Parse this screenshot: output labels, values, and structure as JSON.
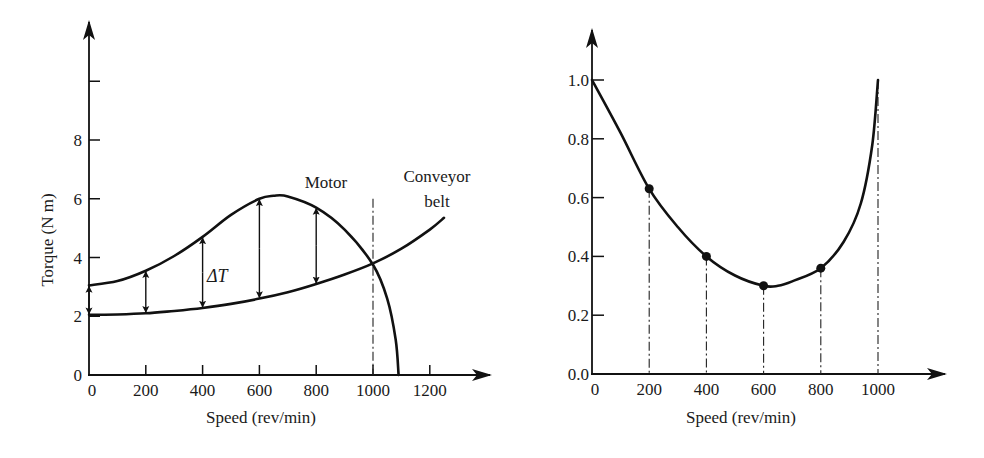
{
  "chart_data": [
    {
      "id": "torque-speed",
      "type": "line",
      "title": "",
      "xlabel": "Speed (rev/min)",
      "ylabel": "Torque (N m)",
      "xlim": [
        0,
        1350
      ],
      "ylim": [
        0,
        10
      ],
      "xticks": [
        0,
        200,
        400,
        600,
        800,
        1000,
        1200
      ],
      "xtick_labels": [
        "0",
        "200",
        "400",
        "600",
        "800",
        "1000",
        "1200"
      ],
      "yticks": [
        0,
        2,
        4,
        6,
        8,
        10
      ],
      "ytick_labels": [
        "0",
        "2",
        "4",
        "6",
        "8",
        ""
      ],
      "grid": false,
      "series": [
        {
          "name": "Motor",
          "x": [
            0,
            100,
            200,
            300,
            400,
            500,
            600,
            650,
            700,
            800,
            900,
            1000,
            1050,
            1080,
            1090
          ],
          "y": [
            3.05,
            3.2,
            3.55,
            4.05,
            4.7,
            5.45,
            6.0,
            6.1,
            6.08,
            5.7,
            4.95,
            3.75,
            2.6,
            1.2,
            0
          ]
        },
        {
          "name": "Conveyor belt",
          "x": [
            0,
            100,
            200,
            300,
            400,
            500,
            600,
            700,
            800,
            900,
            1000,
            1100,
            1200,
            1250
          ],
          "y": [
            2.05,
            2.06,
            2.1,
            2.18,
            2.28,
            2.42,
            2.6,
            2.82,
            3.1,
            3.42,
            3.8,
            4.3,
            4.95,
            5.35
          ]
        }
      ],
      "delta_arrows_at": [
        0,
        200,
        400,
        600,
        800
      ],
      "delta_label": "ΔT",
      "equilibrium_marker_x": 1000,
      "annotations": [
        {
          "text": "Motor",
          "near": "top of motor curve, right of peak"
        },
        {
          "text": "Conveyor",
          "near": "top-right"
        },
        {
          "text": "belt",
          "near": "top-right"
        }
      ]
    },
    {
      "id": "inverse-delta-torque",
      "type": "line",
      "title": "",
      "xlabel": "Speed (rev/min)",
      "ylabel_parts": {
        "numerator": "1",
        "denominator": "ΔT",
        "units": "(N m)",
        "exponent": "−1"
      },
      "xlim": [
        0,
        1150
      ],
      "ylim": [
        0,
        1.0
      ],
      "xticks": [
        0,
        200,
        400,
        600,
        800,
        1000
      ],
      "xtick_labels": [
        "0",
        "200",
        "400",
        "600",
        "800",
        "1000"
      ],
      "yticks": [
        0.0,
        0.2,
        0.4,
        0.6,
        0.8,
        1.0
      ],
      "ytick_labels": [
        "0.0",
        "0.2",
        "0.4",
        "0.6",
        "0.8",
        "1.0"
      ],
      "grid": false,
      "series": [
        {
          "name": "1/ΔT",
          "x": [
            0,
            100,
            200,
            300,
            400,
            500,
            600,
            650,
            700,
            800,
            880,
            940,
            980,
            1000
          ],
          "y": [
            1.0,
            0.82,
            0.63,
            0.5,
            0.4,
            0.335,
            0.3,
            0.3,
            0.315,
            0.36,
            0.45,
            0.58,
            0.78,
            1.0
          ]
        }
      ],
      "markers": {
        "x": [
          200,
          400,
          600,
          800
        ],
        "y": [
          0.63,
          0.4,
          0.3,
          0.36
        ]
      },
      "dropline_x": [
        200,
        400,
        600,
        800,
        1000
      ]
    }
  ]
}
